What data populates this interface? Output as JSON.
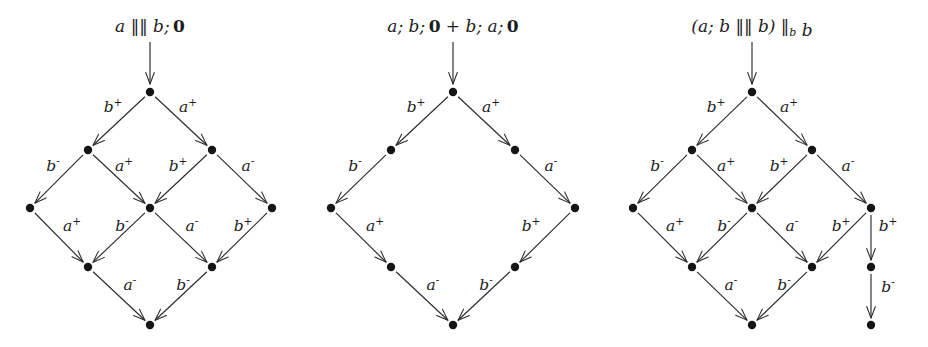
{
  "figure": {
    "background_color": "#ffffff",
    "node_color": "#151515",
    "edge_color": "#2b2b2b",
    "text_color": "#1c1c1c",
    "width": 928,
    "height": 347
  },
  "diagrams": [
    {
      "id": "diagram-1",
      "caption_parts": [
        {
          "text": "a ",
          "style": "italic"
        },
        {
          "text": "‖‖",
          "style": "upright"
        },
        {
          "text": " b; ",
          "style": "italic"
        },
        {
          "text": "0",
          "style": "bold"
        }
      ],
      "caption_text": "a ||| b; 0",
      "caption_x": 150,
      "caption_y": 32,
      "entry_arrow": {
        "x": 150,
        "y1": 42,
        "y2": 84
      },
      "nodes": [
        {
          "id": "n0",
          "x": 150,
          "y": 92
        },
        {
          "id": "n1",
          "x": 88,
          "y": 150
        },
        {
          "id": "n2",
          "x": 212,
          "y": 150
        },
        {
          "id": "n3",
          "x": 30,
          "y": 208
        },
        {
          "id": "n4",
          "x": 150,
          "y": 208
        },
        {
          "id": "n5",
          "x": 272,
          "y": 208
        },
        {
          "id": "n6",
          "x": 88,
          "y": 267
        },
        {
          "id": "n7",
          "x": 212,
          "y": 267
        },
        {
          "id": "n8",
          "x": 150,
          "y": 325
        }
      ],
      "edges": [
        {
          "from": "n0",
          "to": "n1",
          "label": "b",
          "sign": "+",
          "lx": 113,
          "ly": 112
        },
        {
          "from": "n0",
          "to": "n2",
          "label": "a",
          "sign": "+",
          "lx": 188,
          "ly": 112
        },
        {
          "from": "n1",
          "to": "n3",
          "label": "b",
          "sign": "-",
          "lx": 53,
          "ly": 171
        },
        {
          "from": "n1",
          "to": "n4",
          "label": "a",
          "sign": "+",
          "lx": 124,
          "ly": 171
        },
        {
          "from": "n2",
          "to": "n4",
          "label": "b",
          "sign": "+",
          "lx": 178,
          "ly": 171
        },
        {
          "from": "n2",
          "to": "n5",
          "label": "a",
          "sign": "-",
          "lx": 248,
          "ly": 171
        },
        {
          "from": "n3",
          "to": "n6",
          "label": "a",
          "sign": "+",
          "lx": 72,
          "ly": 231
        },
        {
          "from": "n4",
          "to": "n6",
          "label": "b",
          "sign": "-",
          "lx": 122,
          "ly": 231
        },
        {
          "from": "n4",
          "to": "n7",
          "label": "a",
          "sign": "-",
          "lx": 192,
          "ly": 231
        },
        {
          "from": "n5",
          "to": "n7",
          "label": "b",
          "sign": "+",
          "lx": 243,
          "ly": 231
        },
        {
          "from": "n6",
          "to": "n8",
          "label": "a",
          "sign": "-",
          "lx": 130,
          "ly": 290
        },
        {
          "from": "n7",
          "to": "n8",
          "label": "b",
          "sign": "-",
          "lx": 183,
          "ly": 290
        }
      ]
    },
    {
      "id": "diagram-2",
      "caption_parts": [
        {
          "text": "a; b; ",
          "style": "italic"
        },
        {
          "text": "0",
          "style": "bold"
        },
        {
          "text": " + ",
          "style": "upright"
        },
        {
          "text": "b; a; ",
          "style": "italic"
        },
        {
          "text": "0",
          "style": "bold"
        }
      ],
      "caption_text": "a; b; 0 + b; a; 0",
      "caption_x": 453,
      "caption_y": 32,
      "entry_arrow": {
        "x": 453,
        "y1": 42,
        "y2": 84
      },
      "nodes": [
        {
          "id": "m0",
          "x": 453,
          "y": 92
        },
        {
          "id": "m1",
          "x": 391,
          "y": 150
        },
        {
          "id": "m2",
          "x": 515,
          "y": 150
        },
        {
          "id": "m3",
          "x": 331,
          "y": 208
        },
        {
          "id": "m4",
          "x": 575,
          "y": 208
        },
        {
          "id": "m5",
          "x": 391,
          "y": 267
        },
        {
          "id": "m6",
          "x": 515,
          "y": 267
        },
        {
          "id": "m7",
          "x": 453,
          "y": 325
        }
      ],
      "edges": [
        {
          "from": "m0",
          "to": "m1",
          "label": "b",
          "sign": "+",
          "lx": 416,
          "ly": 112
        },
        {
          "from": "m0",
          "to": "m2",
          "label": "a",
          "sign": "+",
          "lx": 491,
          "ly": 112
        },
        {
          "from": "m1",
          "to": "m3",
          "label": "b",
          "sign": "-",
          "lx": 355,
          "ly": 171
        },
        {
          "from": "m2",
          "to": "m4",
          "label": "a",
          "sign": "-",
          "lx": 551,
          "ly": 171
        },
        {
          "from": "m3",
          "to": "m5",
          "label": "a",
          "sign": "+",
          "lx": 375,
          "ly": 231
        },
        {
          "from": "m4",
          "to": "m6",
          "label": "b",
          "sign": "+",
          "lx": 531,
          "ly": 231
        },
        {
          "from": "m5",
          "to": "m7",
          "label": "a",
          "sign": "-",
          "lx": 433,
          "ly": 290
        },
        {
          "from": "m6",
          "to": "m7",
          "label": "b",
          "sign": "-",
          "lx": 486,
          "ly": 290
        }
      ]
    },
    {
      "id": "diagram-3",
      "caption_parts": [
        {
          "text": "(a; b ",
          "style": "italic"
        },
        {
          "text": "‖‖",
          "style": "upright"
        },
        {
          "text": " b) ",
          "style": "italic"
        },
        {
          "text": "‖",
          "style": "upright"
        },
        {
          "text": "b",
          "style": "subscript"
        },
        {
          "text": " b",
          "style": "italic"
        }
      ],
      "caption_text": "(a; b ||| b) ||_b b",
      "caption_x": 752,
      "caption_y": 32,
      "entry_arrow": {
        "x": 752,
        "y1": 42,
        "y2": 84
      },
      "nodes": [
        {
          "id": "p0",
          "x": 752,
          "y": 92
        },
        {
          "id": "p1",
          "x": 692,
          "y": 150
        },
        {
          "id": "p2",
          "x": 812,
          "y": 150
        },
        {
          "id": "p3",
          "x": 633,
          "y": 208
        },
        {
          "id": "p4",
          "x": 752,
          "y": 208
        },
        {
          "id": "p5",
          "x": 871,
          "y": 208
        },
        {
          "id": "p6",
          "x": 692,
          "y": 267
        },
        {
          "id": "p7",
          "x": 812,
          "y": 267
        },
        {
          "id": "p8",
          "x": 871,
          "y": 267
        },
        {
          "id": "p9",
          "x": 752,
          "y": 325
        },
        {
          "id": "p10",
          "x": 871,
          "y": 325
        }
      ],
      "edges": [
        {
          "from": "p0",
          "to": "p1",
          "label": "b",
          "sign": "+",
          "lx": 716,
          "ly": 112
        },
        {
          "from": "p0",
          "to": "p2",
          "label": "a",
          "sign": "+",
          "lx": 789,
          "ly": 112
        },
        {
          "from": "p1",
          "to": "p3",
          "label": "b",
          "sign": "-",
          "lx": 657,
          "ly": 171
        },
        {
          "from": "p1",
          "to": "p4",
          "label": "a",
          "sign": "+",
          "lx": 726,
          "ly": 171
        },
        {
          "from": "p2",
          "to": "p4",
          "label": "b",
          "sign": "+",
          "lx": 779,
          "ly": 171
        },
        {
          "from": "p2",
          "to": "p5",
          "label": "a",
          "sign": "-",
          "lx": 848,
          "ly": 171
        },
        {
          "from": "p3",
          "to": "p6",
          "label": "a",
          "sign": "+",
          "lx": 675,
          "ly": 231
        },
        {
          "from": "p4",
          "to": "p6",
          "label": "b",
          "sign": "-",
          "lx": 724,
          "ly": 231
        },
        {
          "from": "p4",
          "to": "p7",
          "label": "a",
          "sign": "-",
          "lx": 792,
          "ly": 231
        },
        {
          "from": "p5",
          "to": "p7",
          "label": "b",
          "sign": "+",
          "lx": 841,
          "ly": 231
        },
        {
          "from": "p5",
          "to": "p8",
          "label": "b",
          "sign": "+",
          "lx": 888,
          "ly": 231
        },
        {
          "from": "p6",
          "to": "p9",
          "label": "a",
          "sign": "-",
          "lx": 731,
          "ly": 290
        },
        {
          "from": "p7",
          "to": "p9",
          "label": "b",
          "sign": "-",
          "lx": 784,
          "ly": 290
        },
        {
          "from": "p8",
          "to": "p10",
          "label": "b",
          "sign": "-",
          "lx": 888,
          "ly": 292
        }
      ]
    }
  ]
}
